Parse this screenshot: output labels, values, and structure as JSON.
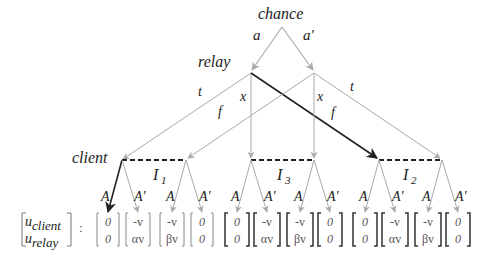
{
  "nodes": {
    "chance": "chance",
    "relay": "relay",
    "client": "client"
  },
  "chance_actions": [
    "a",
    "a'"
  ],
  "relay_actions": {
    "t_left": "t",
    "x_left": "x",
    "f_right": "f",
    "x_right": "x",
    "t_right": "t",
    "f_left": "f"
  },
  "info_sets": [
    "I",
    "1",
    "I",
    "3",
    "I",
    "2"
  ],
  "client_actions": [
    "A",
    "A'"
  ],
  "payoff_header": {
    "top": "u",
    "top_sub": "client",
    "bottom": "u",
    "bottom_sub": "relay",
    "colon": ":"
  },
  "payoffs": [
    [
      "0",
      "0"
    ],
    [
      "-v",
      "αv"
    ],
    [
      "-v",
      "βv"
    ],
    [
      "0",
      "0"
    ],
    [
      "0",
      "0"
    ],
    [
      "-v",
      "αv"
    ],
    [
      "-v",
      "βv"
    ],
    [
      "0",
      "0"
    ],
    [
      "0",
      "0"
    ],
    [
      "-v",
      "αv"
    ],
    [
      "-v",
      "βv"
    ],
    [
      "0",
      "0"
    ]
  ],
  "colors": {
    "edge": "#b0b0b0",
    "highlight": "#222222",
    "dashed": "#222222"
  }
}
